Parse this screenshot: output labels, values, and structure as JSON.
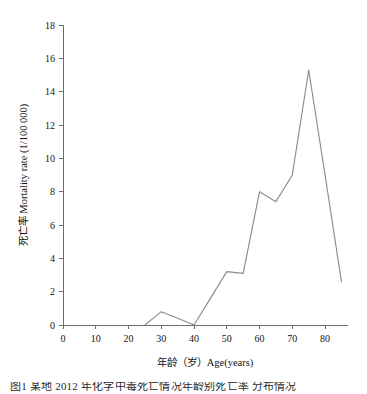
{
  "figure": {
    "background_color": "#ffffff",
    "line_color": "#8c8c8c",
    "axis_color": "#6b6b6b",
    "caption_partial": "图1 某地 2012 年化学中毒死亡情况年龄别死亡率 分布情况"
  },
  "chart_data": {
    "type": "line",
    "title": "",
    "xlabel": "年龄（岁）Age(years)",
    "ylabel": "死亡率 Mortality rate (1/100 000)",
    "xlim": [
      0,
      87
    ],
    "ylim": [
      0,
      18
    ],
    "xticks": [
      0,
      10,
      20,
      30,
      40,
      50,
      60,
      70,
      80
    ],
    "xtick_labels": [
      "0",
      "10",
      "20",
      "30",
      "40",
      "50",
      "60",
      "70",
      "80"
    ],
    "yticks": [
      0,
      2,
      4,
      6,
      8,
      10,
      12,
      14,
      16,
      18
    ],
    "ytick_labels": [
      "0",
      "2",
      "4",
      "6",
      "8",
      "10",
      "12",
      "14",
      "16",
      "18"
    ],
    "grid": false,
    "legend": null,
    "legend_position": "none",
    "series": [
      {
        "name": "死亡率 Mortality rate",
        "color": "#8c8c8c",
        "x": [
          25,
          30,
          35,
          40,
          45,
          50,
          55,
          60,
          65,
          70,
          75,
          80,
          85
        ],
        "values": [
          0.0,
          0.8,
          0.4,
          0.0,
          1.6,
          3.2,
          3.1,
          8.0,
          7.4,
          9.0,
          15.3,
          9.0,
          2.6
        ]
      }
    ]
  }
}
